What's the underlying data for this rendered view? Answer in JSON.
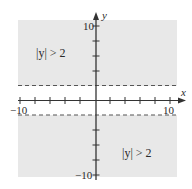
{
  "graph": {
    "inequality_label_top": "|y| > 2",
    "inequality_label_bottom": "|y| > 2",
    "x_axis_label": "x",
    "y_axis_label": "y",
    "x_tick_labels": {
      "min": "−10",
      "max": "10"
    },
    "y_tick_labels": {
      "max": "10",
      "min": "−10"
    },
    "boundary_lines": [
      {
        "equation": "y = 2",
        "style": "dashed"
      },
      {
        "equation": "y = -2",
        "style": "dashed"
      }
    ],
    "colors": {
      "shade": "#e8e8e8",
      "axis": "#333333",
      "dash": "#555555"
    },
    "range": {
      "x": [
        -10,
        10
      ],
      "y": [
        -10,
        10
      ]
    },
    "tick_step": 2
  }
}
